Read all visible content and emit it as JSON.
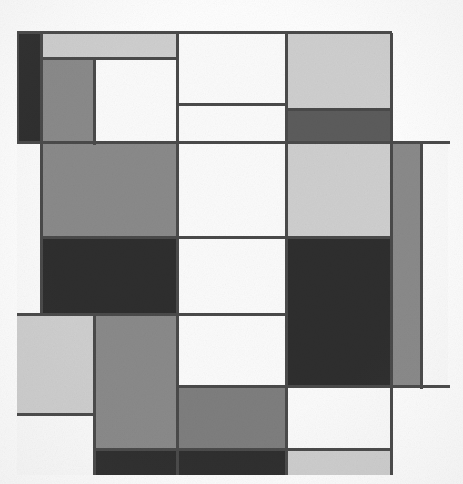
{
  "artwork": {
    "title": "Mondrian-style Neoplastic Composition (grayscale reproduction)",
    "medium": "Grayscale halftone reproduction of a geometric abstract painting",
    "canvas": {
      "width": 463,
      "height": 484,
      "background": "#fefefe"
    },
    "composition_bounds": {
      "left": 17,
      "top": 33,
      "right": 450,
      "bottom": 475
    },
    "palette": {
      "black": "#2e2e2e",
      "dark_gray": "#454545",
      "mid_dark_gray": "#5c5c5c",
      "mid_gray": "#8a8a8a",
      "light_mid_gray": "#a6a6a6",
      "light_gray": "#cfcfcf",
      "pale_gray": "#dedede",
      "white": "#fbfbfb",
      "line": "#4a4a4a",
      "page": "#fefefe"
    },
    "grid": {
      "vertical_dividers": [
        17,
        42,
        95,
        178,
        287,
        392,
        422,
        448
      ],
      "horizontal_dividers": [
        33,
        59,
        105,
        143,
        238,
        315,
        387,
        450,
        475
      ]
    },
    "blocks": [
      {
        "name": "black-left-column",
        "x": 17,
        "y": 33,
        "w": 25,
        "h": 110,
        "fill": "#2e2e2e"
      },
      {
        "name": "light-gray-top-bar",
        "x": 42,
        "y": 33,
        "w": 136,
        "h": 26,
        "fill": "#cfcfcf"
      },
      {
        "name": "mid-gray-upper-left",
        "x": 42,
        "y": 59,
        "w": 53,
        "h": 84,
        "fill": "#8a8a8a"
      },
      {
        "name": "white-upper-inner",
        "x": 95,
        "y": 59,
        "w": 83,
        "h": 84,
        "fill": "#fbfbfb"
      },
      {
        "name": "white-top-center",
        "x": 178,
        "y": 33,
        "w": 109,
        "h": 72,
        "fill": "#fbfbfb"
      },
      {
        "name": "white-top-center-lower",
        "x": 178,
        "y": 105,
        "w": 109,
        "h": 38,
        "fill": "#fbfbfb"
      },
      {
        "name": "light-gray-top-right",
        "x": 287,
        "y": 33,
        "w": 105,
        "h": 77,
        "fill": "#cfcfcf"
      },
      {
        "name": "mid-dark-gray-top-right",
        "x": 287,
        "y": 110,
        "w": 105,
        "h": 33,
        "fill": "#5c5c5c"
      },
      {
        "name": "white-top-right-margin",
        "x": 392,
        "y": 33,
        "w": 56,
        "h": 110,
        "fill": "#fefefe"
      },
      {
        "name": "white-mid-left-margin",
        "x": 17,
        "y": 143,
        "w": 25,
        "h": 172,
        "fill": "#fbfbfb"
      },
      {
        "name": "mid-gray-center-large",
        "x": 42,
        "y": 143,
        "w": 136,
        "h": 95,
        "fill": "#8a8a8a"
      },
      {
        "name": "black-center-large",
        "x": 42,
        "y": 238,
        "w": 136,
        "h": 77,
        "fill": "#2e2e2e"
      },
      {
        "name": "white-center-tall",
        "x": 178,
        "y": 143,
        "w": 109,
        "h": 95,
        "fill": "#fbfbfb"
      },
      {
        "name": "white-center-lower",
        "x": 178,
        "y": 238,
        "w": 109,
        "h": 77,
        "fill": "#fbfbfb"
      },
      {
        "name": "light-gray-center-right",
        "x": 287,
        "y": 143,
        "w": 105,
        "h": 95,
        "fill": "#cfcfcf"
      },
      {
        "name": "black-right-large",
        "x": 287,
        "y": 238,
        "w": 105,
        "h": 149,
        "fill": "#2e2e2e"
      },
      {
        "name": "mid-gray-right-strip",
        "x": 392,
        "y": 143,
        "w": 30,
        "h": 244,
        "fill": "#8a8a8a"
      },
      {
        "name": "white-far-right-column",
        "x": 422,
        "y": 143,
        "w": 26,
        "h": 244,
        "fill": "#fbfbfb"
      },
      {
        "name": "light-gray-lower-left",
        "x": 17,
        "y": 315,
        "w": 78,
        "h": 100,
        "fill": "#cfcfcf"
      },
      {
        "name": "white-lower-left-bottom",
        "x": 17,
        "y": 415,
        "w": 78,
        "h": 60,
        "fill": "#fbfbfb"
      },
      {
        "name": "mid-gray-lower-tall",
        "x": 95,
        "y": 315,
        "w": 83,
        "h": 135,
        "fill": "#8a8a8a"
      },
      {
        "name": "white-lower-center",
        "x": 178,
        "y": 315,
        "w": 109,
        "h": 72,
        "fill": "#fbfbfb"
      },
      {
        "name": "mid-gray-lower-center",
        "x": 178,
        "y": 387,
        "w": 109,
        "h": 63,
        "fill": "#7e7e7e"
      },
      {
        "name": "black-bottom-bar",
        "x": 95,
        "y": 450,
        "w": 192,
        "h": 25,
        "fill": "#2e2e2e"
      },
      {
        "name": "white-lower-right",
        "x": 287,
        "y": 387,
        "w": 105,
        "h": 63,
        "fill": "#fbfbfb"
      },
      {
        "name": "light-gray-bottom-right",
        "x": 287,
        "y": 450,
        "w": 105,
        "h": 25,
        "fill": "#cfcfcf"
      }
    ],
    "lines": {
      "vertical": [
        {
          "name": "line-v-left-edge",
          "x": 17,
          "y": 33,
          "h": 110,
          "w": 2
        },
        {
          "name": "line-v-x42",
          "x": 40,
          "y": 33,
          "h": 282,
          "w": 3
        },
        {
          "name": "line-v-x95-upper",
          "x": 93,
          "y": 57,
          "h": 88,
          "w": 3
        },
        {
          "name": "line-v-x95-lower",
          "x": 93,
          "y": 313,
          "h": 162,
          "w": 3
        },
        {
          "name": "line-v-x178-upper",
          "x": 176,
          "y": 33,
          "h": 282,
          "w": 3
        },
        {
          "name": "line-v-x178-lower",
          "x": 176,
          "y": 313,
          "h": 162,
          "w": 3
        },
        {
          "name": "line-v-x287-upper",
          "x": 285,
          "y": 33,
          "h": 354,
          "w": 3
        },
        {
          "name": "line-v-x287-lower",
          "x": 285,
          "y": 387,
          "h": 88,
          "w": 3
        },
        {
          "name": "line-v-x392",
          "x": 390,
          "y": 33,
          "h": 442,
          "w": 3
        },
        {
          "name": "line-v-x422",
          "x": 420,
          "y": 143,
          "h": 246,
          "w": 3
        }
      ],
      "horizontal": [
        {
          "name": "line-h-y33",
          "x": 17,
          "y": 31,
          "w": 375,
          "h": 3
        },
        {
          "name": "line-h-y59",
          "x": 40,
          "y": 57,
          "w": 138,
          "h": 3
        },
        {
          "name": "line-h-y105",
          "x": 176,
          "y": 103,
          "w": 111,
          "h": 3
        },
        {
          "name": "line-h-y110-right",
          "x": 285,
          "y": 108,
          "w": 107,
          "h": 3
        },
        {
          "name": "line-h-y143",
          "x": 17,
          "y": 141,
          "w": 433,
          "h": 3
        },
        {
          "name": "line-h-y238",
          "x": 40,
          "y": 236,
          "w": 352,
          "h": 3
        },
        {
          "name": "line-h-y315",
          "x": 17,
          "y": 313,
          "w": 270,
          "h": 3
        },
        {
          "name": "line-h-y387-left",
          "x": 176,
          "y": 385,
          "w": 111,
          "h": 3
        },
        {
          "name": "line-h-y387-right",
          "x": 285,
          "y": 385,
          "w": 165,
          "h": 3
        },
        {
          "name": "line-h-y415",
          "x": 17,
          "y": 413,
          "w": 78,
          "h": 3
        },
        {
          "name": "line-h-y450",
          "x": 93,
          "y": 448,
          "w": 299,
          "h": 3
        }
      ]
    }
  }
}
